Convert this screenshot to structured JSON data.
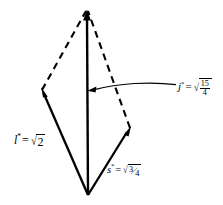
{
  "figure": {
    "kind": "vector-addition-diagram",
    "background_color": "#ffffff",
    "stroke_color": "#000000",
    "width": 223,
    "height": 205
  },
  "geometry": {
    "origin_vertex": {
      "x": 88,
      "y": 195
    },
    "apex_vertex": {
      "x": 87,
      "y": 10
    },
    "left_vertex": {
      "x": 42,
      "y": 90
    },
    "right_vertex": {
      "x": 130,
      "y": 128
    }
  },
  "vectors": [
    {
      "id": "l-vector",
      "style": "solid",
      "from": "origin_vertex",
      "to": "left_vertex",
      "arrowhead": true
    },
    {
      "id": "j-vector",
      "style": "solid",
      "from": "origin_vertex",
      "to": "apex_vertex",
      "arrowhead": true
    },
    {
      "id": "s-vector",
      "style": "solid",
      "from": "origin_vertex",
      "to": "right_vertex",
      "arrowhead": true
    },
    {
      "id": "l-parallel-edge",
      "style": "dashed",
      "from": "right_vertex",
      "to": "apex_vertex",
      "arrowhead": false
    },
    {
      "id": "s-parallel-edge",
      "style": "dashed",
      "from": "left_vertex",
      "to": "apex_vertex",
      "arrowhead": false
    }
  ],
  "labels": {
    "l": {
      "symbol": "l",
      "star": "*",
      "equals": "=",
      "radical_sign": "√",
      "radicand": "2",
      "text": "l* = √2"
    },
    "s": {
      "symbol": "s",
      "star": "*",
      "equals": "=",
      "radical_sign": "√",
      "numerator": "3",
      "solidus": "⁄",
      "denominator": "4",
      "text": "s* = √(3/4)"
    },
    "j": {
      "symbol": "j",
      "star": "*",
      "equals": "=",
      "radical_sign": "√",
      "numerator": "15",
      "denominator": "4",
      "text": "j* = √(15/4)"
    }
  },
  "leader": {
    "id": "j-leader-line",
    "description": "curved leader from j label to the vertical vector",
    "arrow_tip": {
      "x": 88,
      "y": 90
    },
    "tail": {
      "x": 175,
      "y": 85
    }
  }
}
